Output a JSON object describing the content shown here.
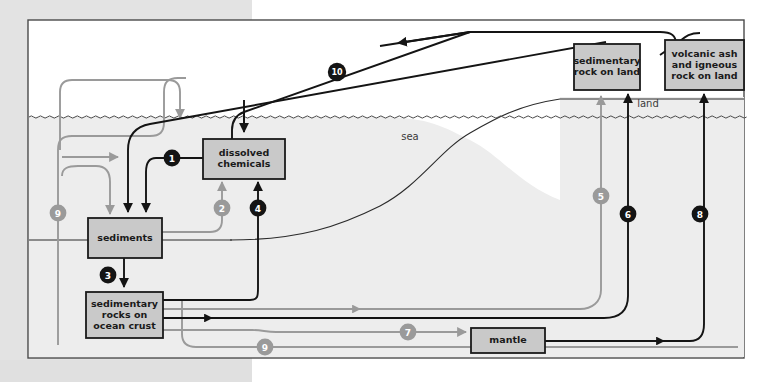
{
  "figure": {
    "background_color": "#ffffff",
    "panel_border_color": "#3a3a3a",
    "sea_fill": "#ededed",
    "box_fill": "#c9c9c9",
    "box_stroke": "#1a1a1a",
    "black_arrow": "#141414",
    "gray_arrow": "#9a9a9a"
  },
  "environment_labels": [
    {
      "id": "sea",
      "text": "sea",
      "x": 410,
      "y": 137
    },
    {
      "id": "land",
      "text": "land",
      "x": 648,
      "y": 104
    }
  ],
  "boxes": [
    {
      "id": "dissolved-chemicals",
      "lines": [
        "dissolved",
        "chemicals"
      ],
      "x": 203,
      "y": 139,
      "w": 82,
      "h": 40
    },
    {
      "id": "sediments",
      "lines": [
        "sediments"
      ],
      "x": 88,
      "y": 218,
      "w": 74,
      "h": 40
    },
    {
      "id": "sedimentary-rocks-on-ocean-crust",
      "lines": [
        "sedimentary",
        "rocks on",
        "ocean crust"
      ],
      "x": 86,
      "y": 292,
      "w": 77,
      "h": 46
    },
    {
      "id": "sedimentary-rock-on-land",
      "lines": [
        "sedimentary",
        "rock on land"
      ],
      "x": 574,
      "y": 44,
      "w": 66,
      "h": 46
    },
    {
      "id": "volcanic-ash-and-igneous-rock-on-land",
      "lines": [
        "volcanic ash",
        "and igneous",
        "rock on land"
      ],
      "x": 665,
      "y": 40,
      "w": 79,
      "h": 50
    },
    {
      "id": "mantle",
      "lines": [
        "mantle"
      ],
      "x": 471,
      "y": 328,
      "w": 74,
      "h": 25
    }
  ],
  "flow_markers": [
    {
      "id": "marker-1",
      "label": "1",
      "x": 172,
      "y": 158,
      "color": "black"
    },
    {
      "id": "marker-2",
      "label": "2",
      "x": 222,
      "y": 208,
      "color": "gray"
    },
    {
      "id": "marker-3",
      "label": "3",
      "x": 108,
      "y": 275,
      "color": "black"
    },
    {
      "id": "marker-4",
      "label": "4",
      "x": 258,
      "y": 208,
      "color": "black"
    },
    {
      "id": "marker-5",
      "label": "5",
      "x": 601,
      "y": 196,
      "color": "gray"
    },
    {
      "id": "marker-6",
      "label": "6",
      "x": 628,
      "y": 214,
      "color": "black"
    },
    {
      "id": "marker-7",
      "label": "7",
      "x": 408,
      "y": 332,
      "color": "gray"
    },
    {
      "id": "marker-8",
      "label": "8",
      "x": 700,
      "y": 214,
      "color": "black"
    },
    {
      "id": "marker-9a",
      "label": "9",
      "x": 58,
      "y": 213,
      "color": "gray"
    },
    {
      "id": "marker-9b",
      "label": "9",
      "x": 265,
      "y": 347,
      "color": "gray"
    },
    {
      "id": "marker-10",
      "label": "10",
      "x": 337,
      "y": 72,
      "color": "black"
    }
  ]
}
